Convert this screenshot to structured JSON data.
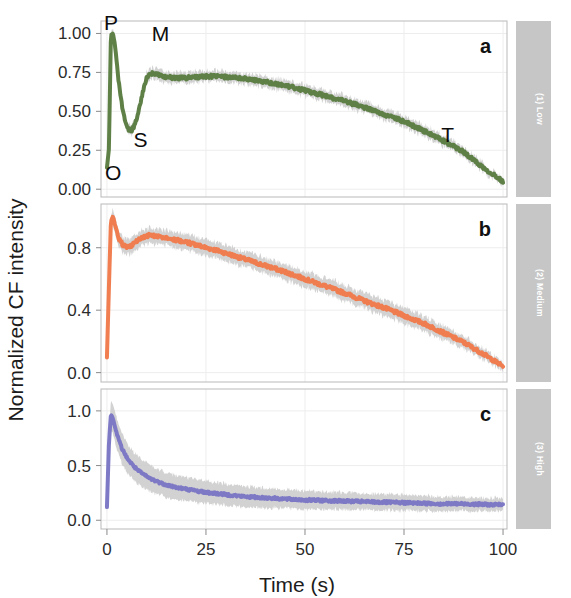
{
  "figure": {
    "y_axis_title": "Normalized CF intensity",
    "x_axis_title": "Time (s)"
  },
  "panels": [
    {
      "letter": "a",
      "side_label": "(1) Low",
      "color": "#5a7d42",
      "band_color": "#c8c8c8",
      "y_ticks": [
        "0.00",
        "0.25",
        "0.50",
        "0.75",
        "1.00"
      ],
      "y_tick_values": [
        0.0,
        0.25,
        0.5,
        0.75,
        1.0
      ],
      "ylim": [
        -0.05,
        1.08
      ],
      "annotations": [
        {
          "text": "P",
          "x": 1.0,
          "y": 1.02
        },
        {
          "text": "O",
          "x": 1.6,
          "y": 0.06
        },
        {
          "text": "S",
          "x": 8.5,
          "y": 0.27
        },
        {
          "text": "M",
          "x": 13.5,
          "y": 0.95
        },
        {
          "text": "T",
          "x": 86.0,
          "y": 0.3
        }
      ]
    },
    {
      "letter": "b",
      "side_label": "(2) Medium",
      "color": "#f07a4a",
      "band_color": "#c8c8c8",
      "y_ticks": [
        "0.0",
        "0.4",
        "0.8"
      ],
      "y_tick_values": [
        0.0,
        0.4,
        0.8
      ],
      "ylim": [
        -0.06,
        1.08
      ],
      "annotations": []
    },
    {
      "letter": "c",
      "side_label": "(3) High",
      "color": "#7b76c4",
      "band_color": "#c8c8c8",
      "y_ticks": [
        "0.0",
        "0.5",
        "1.0"
      ],
      "y_tick_values": [
        0.0,
        0.5,
        1.0
      ],
      "ylim": [
        -0.08,
        1.2
      ],
      "annotations": []
    }
  ],
  "x_axis": {
    "ticks": [
      "0",
      "25",
      "50",
      "75",
      "100"
    ],
    "tick_values": [
      0,
      25,
      50,
      75,
      100
    ],
    "xlim": [
      -1.5,
      101
    ]
  },
  "chart_data": {
    "type": "line",
    "title": "",
    "xlabel": "Time (s)",
    "ylabel": "Normalized CF intensity",
    "xlim": [
      0,
      100
    ],
    "grid": false,
    "legend": "none",
    "x": [
      0,
      0.5,
      1,
      1.5,
      2,
      2.5,
      3,
      4,
      5,
      6,
      7,
      8,
      9,
      10,
      11,
      12,
      13,
      14,
      15,
      17.5,
      20,
      22.5,
      25,
      27.5,
      30,
      32.5,
      35,
      37.5,
      40,
      45,
      50,
      55,
      60,
      65,
      70,
      75,
      80,
      85,
      90,
      95,
      100
    ],
    "series": [
      {
        "name": "(1) Low",
        "panel": "a",
        "color": "#5a7d42",
        "values": [
          0.14,
          0.26,
          0.99,
          1.0,
          0.93,
          0.8,
          0.68,
          0.5,
          0.4,
          0.37,
          0.41,
          0.5,
          0.62,
          0.71,
          0.74,
          0.745,
          0.735,
          0.725,
          0.72,
          0.715,
          0.715,
          0.72,
          0.725,
          0.725,
          0.72,
          0.715,
          0.71,
          0.7,
          0.69,
          0.665,
          0.635,
          0.6,
          0.565,
          0.525,
          0.48,
          0.435,
          0.375,
          0.31,
          0.24,
          0.14,
          0.05
        ],
        "band_half_width": [
          0.02,
          0.03,
          0.03,
          0.03,
          0.03,
          0.03,
          0.03,
          0.03,
          0.03,
          0.03,
          0.03,
          0.03,
          0.03,
          0.035,
          0.035,
          0.035,
          0.035,
          0.035,
          0.035,
          0.035,
          0.035,
          0.035,
          0.035,
          0.035,
          0.035,
          0.035,
          0.035,
          0.035,
          0.035,
          0.035,
          0.035,
          0.035,
          0.035,
          0.035,
          0.035,
          0.035,
          0.035,
          0.035,
          0.03,
          0.03,
          0.025
        ]
      },
      {
        "name": "(2) Medium",
        "panel": "b",
        "color": "#f07a4a",
        "values": [
          0.1,
          0.55,
          0.97,
          1.0,
          0.95,
          0.9,
          0.86,
          0.82,
          0.8,
          0.81,
          0.83,
          0.85,
          0.865,
          0.875,
          0.88,
          0.875,
          0.87,
          0.865,
          0.86,
          0.85,
          0.835,
          0.82,
          0.8,
          0.785,
          0.765,
          0.745,
          0.725,
          0.705,
          0.685,
          0.645,
          0.6,
          0.555,
          0.51,
          0.46,
          0.415,
          0.365,
          0.315,
          0.255,
          0.195,
          0.12,
          0.04
        ],
        "band_half_width": [
          0.03,
          0.05,
          0.05,
          0.05,
          0.05,
          0.05,
          0.05,
          0.05,
          0.05,
          0.05,
          0.05,
          0.05,
          0.05,
          0.05,
          0.05,
          0.05,
          0.05,
          0.05,
          0.05,
          0.05,
          0.05,
          0.05,
          0.05,
          0.05,
          0.05,
          0.05,
          0.05,
          0.05,
          0.05,
          0.05,
          0.05,
          0.05,
          0.05,
          0.05,
          0.05,
          0.05,
          0.05,
          0.045,
          0.04,
          0.035,
          0.03
        ]
      },
      {
        "name": "(3) High",
        "panel": "c",
        "color": "#7b76c4",
        "values": [
          0.12,
          0.7,
          0.97,
          0.93,
          0.86,
          0.79,
          0.73,
          0.64,
          0.575,
          0.525,
          0.485,
          0.45,
          0.425,
          0.4,
          0.38,
          0.365,
          0.35,
          0.335,
          0.325,
          0.3,
          0.285,
          0.27,
          0.255,
          0.245,
          0.235,
          0.225,
          0.215,
          0.21,
          0.205,
          0.195,
          0.185,
          0.18,
          0.175,
          0.17,
          0.165,
          0.16,
          0.155,
          0.15,
          0.15,
          0.145,
          0.14
        ],
        "band_half_width": [
          0.05,
          0.1,
          0.13,
          0.14,
          0.14,
          0.14,
          0.14,
          0.14,
          0.135,
          0.13,
          0.13,
          0.125,
          0.125,
          0.12,
          0.12,
          0.12,
          0.115,
          0.115,
          0.115,
          0.11,
          0.11,
          0.105,
          0.105,
          0.1,
          0.1,
          0.095,
          0.095,
          0.09,
          0.09,
          0.085,
          0.085,
          0.08,
          0.08,
          0.075,
          0.075,
          0.07,
          0.07,
          0.065,
          0.065,
          0.06,
          0.06
        ]
      }
    ],
    "annotations": [
      {
        "panel": "a",
        "text": "O",
        "meaning": "origin / minimal fluorescence"
      },
      {
        "panel": "a",
        "text": "P",
        "meaning": "peak fluorescence"
      },
      {
        "panel": "a",
        "text": "S",
        "meaning": "semi-steady state dip"
      },
      {
        "panel": "a",
        "text": "M",
        "meaning": "secondary maximum"
      },
      {
        "panel": "a",
        "text": "T",
        "meaning": "terminal steady state"
      }
    ]
  }
}
